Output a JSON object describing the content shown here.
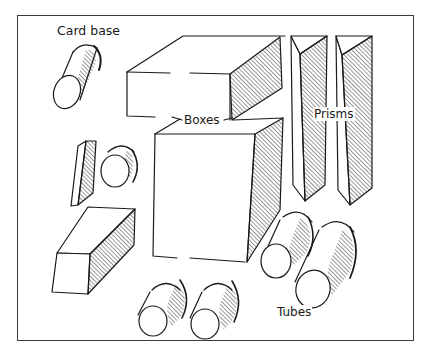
{
  "figure": {
    "labels": {
      "card_base": "Card base",
      "boxes": "Boxes",
      "prisms": "Prisms",
      "tubes": "Tubes"
    },
    "colors": {
      "ink": "#1a1a1a",
      "frame": "#3a3a3a",
      "background": "#ffffff"
    }
  }
}
